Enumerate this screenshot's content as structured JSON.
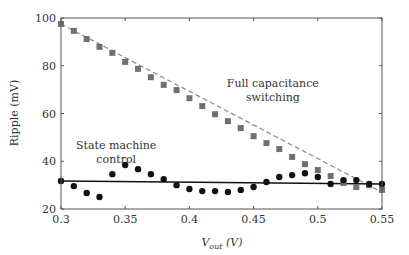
{
  "chart_data": {
    "type": "scatter",
    "title": "",
    "xlabel": "V_out (V)",
    "xlabel_main": "V",
    "xlabel_sub": "out",
    "xlabel_unit": " (V)",
    "ylabel": "Ripple (mV)",
    "xlim": [
      0.3,
      0.55
    ],
    "ylim": [
      20,
      100
    ],
    "x_ticks": [
      0.3,
      0.35,
      0.4,
      0.45,
      0.5,
      0.55
    ],
    "x_tick_labels": [
      "0.3",
      "0.35",
      "0.4",
      "0.45",
      "0.5",
      "0.55"
    ],
    "y_ticks": [
      20,
      40,
      60,
      80,
      100
    ],
    "y_tick_labels": [
      "20",
      "40",
      "60",
      "80",
      "100"
    ],
    "grid": false,
    "legend": null,
    "x": [
      0.3,
      0.31,
      0.32,
      0.33,
      0.34,
      0.35,
      0.36,
      0.37,
      0.38,
      0.39,
      0.4,
      0.41,
      0.42,
      0.43,
      0.44,
      0.45,
      0.46,
      0.47,
      0.48,
      0.49,
      0.5,
      0.51,
      0.52,
      0.53,
      0.54,
      0.55
    ],
    "series": [
      {
        "name": "Full capacitance switching",
        "marker": "square",
        "color": "#707070",
        "values": [
          97.5,
          94.6,
          91.2,
          87.9,
          85.4,
          81.6,
          78.7,
          75.2,
          72.0,
          69.8,
          66.4,
          63.1,
          59.7,
          56.8,
          53.9,
          50.5,
          47.6,
          45.1,
          41.8,
          38.8,
          36.3,
          33.8,
          30.9,
          29.2,
          30.0,
          28.0
        ]
      },
      {
        "name": "State machine control",
        "marker": "circle",
        "color": "#111111",
        "values": [
          31.7,
          29.6,
          26.7,
          25.0,
          34.6,
          38.4,
          36.7,
          34.6,
          32.5,
          30.0,
          28.4,
          27.5,
          27.5,
          27.1,
          28.0,
          29.2,
          31.3,
          33.4,
          34.2,
          35.0,
          33.4,
          30.5,
          32.1,
          32.1,
          30.5,
          30.5
        ]
      }
    ],
    "reference_lines": [
      {
        "name": "Full capacitance switching trend",
        "style": "dashed",
        "color": "#8a8a8a",
        "from": [
          0.3,
          97.5
        ],
        "to": [
          0.55,
          27.0
        ]
      },
      {
        "name": "State machine control mean",
        "style": "solid",
        "color": "#111111",
        "from": [
          0.3,
          31.7
        ],
        "to": [
          0.55,
          30.5
        ]
      }
    ],
    "annotations": [
      {
        "lines": [
          "Full capacitance",
          "switching"
        ],
        "x": 0.465,
        "y": 71
      },
      {
        "lines": [
          "State machine",
          "control"
        ],
        "x": 0.343,
        "y": 45
      }
    ]
  }
}
